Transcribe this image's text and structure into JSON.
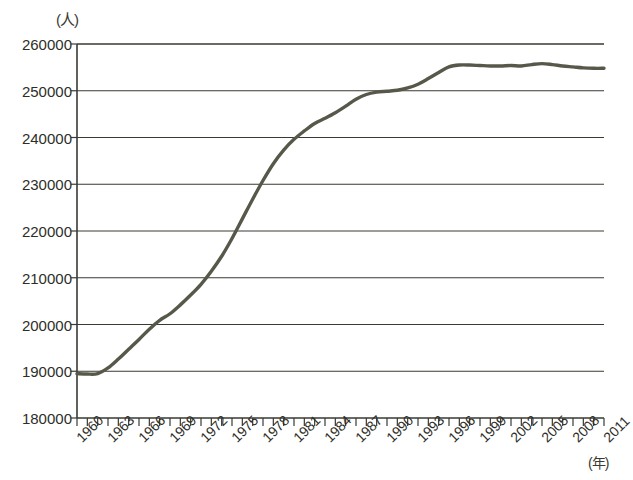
{
  "chart_data": {
    "type": "line",
    "title": "",
    "xlabel": "(年)",
    "ylabel": "(人)",
    "ylim": [
      180000,
      260000
    ],
    "xlim": [
      1960,
      2011
    ],
    "ytick_step": 10000,
    "yticks": [
      "260000",
      "250000",
      "240000",
      "230000",
      "220000",
      "210000",
      "200000",
      "190000",
      "180000"
    ],
    "ytick_values": [
      260000,
      250000,
      240000,
      230000,
      220000,
      210000,
      200000,
      190000,
      180000
    ],
    "xticks": [
      "1960",
      "1963",
      "1966",
      "1969",
      "1972",
      "1975",
      "1978",
      "1981",
      "1984",
      "1987",
      "1990",
      "1993",
      "1996",
      "1999",
      "2002",
      "2005",
      "2008",
      "2011"
    ],
    "xtick_values": [
      1960,
      1963,
      1966,
      1969,
      1972,
      1975,
      1978,
      1981,
      1984,
      1987,
      1990,
      1993,
      1996,
      1999,
      2002,
      2005,
      2008,
      2011
    ],
    "minor_tick_interval": 1,
    "grid": "horizontal",
    "legend": "none",
    "line_color": "#58584a",
    "axis_color": "#3a3a33",
    "background": "#ffffff",
    "x": [
      1960,
      1961,
      1962,
      1963,
      1964,
      1965,
      1966,
      1967,
      1968,
      1969,
      1970,
      1971,
      1972,
      1973,
      1974,
      1975,
      1976,
      1977,
      1978,
      1979,
      1980,
      1981,
      1982,
      1983,
      1984,
      1985,
      1986,
      1987,
      1988,
      1989,
      1990,
      1991,
      1992,
      1993,
      1994,
      1995,
      1996,
      1997,
      1998,
      1999,
      2000,
      2001,
      2002,
      2003,
      2004,
      2005,
      2006,
      2007,
      2008,
      2009,
      2010,
      2011
    ],
    "values": [
      189500,
      189400,
      189500,
      190700,
      192600,
      194700,
      196800,
      199000,
      200900,
      202300,
      204200,
      206300,
      208600,
      211400,
      214600,
      218400,
      222600,
      226800,
      230800,
      234400,
      237300,
      239600,
      241400,
      243000,
      244100,
      245300,
      246700,
      248200,
      249200,
      249700,
      249900,
      250100,
      250600,
      251400,
      252600,
      253900,
      255100,
      255500,
      255500,
      255400,
      255300,
      255300,
      255400,
      255300,
      255600,
      255800,
      255600,
      255300,
      255100,
      254900,
      254800,
      254800
    ],
    "series_name": "人数"
  }
}
